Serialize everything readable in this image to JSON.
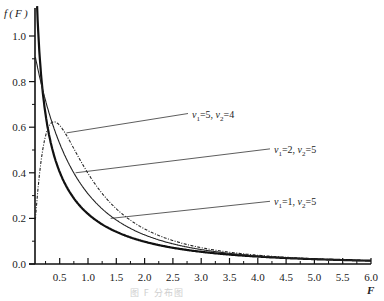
{
  "chart_data": {
    "type": "line",
    "title": "",
    "xlabel": "F",
    "ylabel": "f(F)",
    "xlim": [
      0.07,
      6.0
    ],
    "ylim": [
      0.0,
      1.1
    ],
    "grid": false,
    "x_ticks": [
      "0.5",
      "1.0",
      "1.5",
      "2.0",
      "2.5",
      "3.0",
      "3.5",
      "4.0",
      "4.5",
      "5.0",
      "5.5",
      "6.0"
    ],
    "x_tick_values": [
      0.5,
      1.0,
      1.5,
      2.0,
      2.5,
      3.0,
      3.5,
      4.0,
      4.5,
      5.0,
      5.5,
      6.0
    ],
    "y_ticks": [
      "0.0",
      "0.2",
      "0.4",
      "0.6",
      "0.8",
      "1.0"
    ],
    "y_tick_values": [
      0.0,
      0.2,
      0.4,
      0.6,
      0.8,
      1.0
    ],
    "series": [
      {
        "name": "ν1=1, ν2=5",
        "v1": 1,
        "v2": 5,
        "style": "thick-solid",
        "x": [
          0.1,
          0.25,
          0.5,
          0.75,
          1.0,
          1.5,
          2.0,
          3.0,
          4.0,
          5.0,
          6.0
        ],
        "values": [
          1.08,
          0.63,
          0.4,
          0.29,
          0.22,
          0.14,
          0.1,
          0.055,
          0.034,
          0.022,
          0.015
        ]
      },
      {
        "name": "ν1=2, ν2=5",
        "v1": 2,
        "v2": 5,
        "style": "thin-solid",
        "x": [
          0.1,
          0.25,
          0.5,
          0.75,
          1.0,
          1.5,
          2.0,
          3.0,
          4.0,
          5.0,
          6.0
        ],
        "values": [
          0.91,
          0.75,
          0.55,
          0.41,
          0.31,
          0.19,
          0.13,
          0.066,
          0.039,
          0.025,
          0.017
        ]
      },
      {
        "name": "ν1=5, ν2=4",
        "v1": 5,
        "v2": 4,
        "style": "dashed",
        "x": [
          0.1,
          0.25,
          0.5,
          0.75,
          1.0,
          1.5,
          2.0,
          3.0,
          4.0,
          5.0,
          6.0
        ],
        "values": [
          0.26,
          0.55,
          0.62,
          0.55,
          0.46,
          0.31,
          0.21,
          0.11,
          0.064,
          0.041,
          0.028
        ]
      }
    ],
    "annotations": [
      {
        "text": "ν1=5, ν2=4",
        "points_to": "ν1=5, ν2=4 curve near F≈0.65"
      },
      {
        "text": "ν1=2, ν2=5",
        "points_to": "ν1=2, ν2=5 curve near F≈0.75"
      },
      {
        "text": "ν1=1, ν2=5",
        "points_to": "ν1=1, ν2=5 curve near F≈1.4"
      }
    ]
  },
  "labels": {
    "y_axis_title": "f ( F )",
    "x_axis_title": "F",
    "legend": [
      {
        "nu1": "5",
        "nu2": "4",
        "sep": ","
      },
      {
        "nu1": "2",
        "nu2": "5",
        "sep": ","
      },
      {
        "nu1": "1",
        "nu2": "5",
        "sep": ","
      }
    ],
    "caption": "图  F 分布图"
  }
}
